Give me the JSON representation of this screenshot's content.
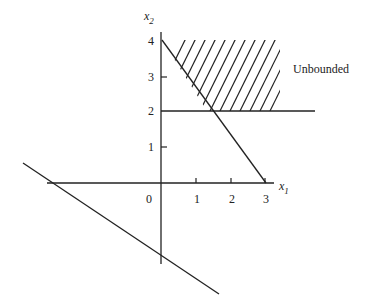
{
  "figure": {
    "axes": {
      "x_label": "x",
      "x_sub": "1",
      "y_label": "x",
      "y_sub": "2",
      "x_ticks": [
        "0",
        "1",
        "2",
        "3"
      ],
      "y_ticks": [
        "1",
        "2",
        "3",
        "4"
      ]
    },
    "annotation": "Unbounded",
    "constraints": [
      {
        "name": "line-x1-plus-0.75x2-eq-3",
        "from": [
          0,
          4
        ],
        "to": [
          3,
          0
        ]
      },
      {
        "name": "horizontal-line-x2-eq-2",
        "from": [
          0,
          2
        ],
        "to": [
          5.5,
          2
        ]
      },
      {
        "name": "negative-slope-line",
        "from": [
          -4.5,
          1
        ],
        "to": [
          1.5,
          -3
        ]
      }
    ],
    "feasible_region": "hatched region above x2=2 and right of diagonal line, unbounded",
    "colors": {
      "ink": "#222222",
      "background": "#ffffff"
    }
  }
}
